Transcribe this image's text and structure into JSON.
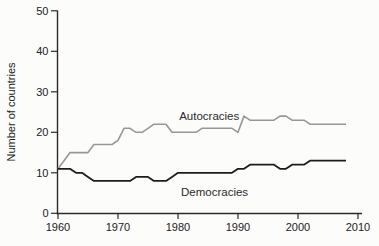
{
  "chart_data": {
    "type": "line",
    "title": "",
    "xlabel": "",
    "ylabel": "Number of countries",
    "x_ticks": [
      1960,
      1970,
      1980,
      1990,
      2000,
      2010
    ],
    "y_ticks": [
      0,
      10,
      20,
      30,
      40,
      50
    ],
    "xlim": [
      1960,
      2010
    ],
    "ylim": [
      0,
      50
    ],
    "grid": false,
    "legend_position": "inline-labels",
    "x_start_year": 1960,
    "x": [
      1960,
      1961,
      1962,
      1963,
      1964,
      1965,
      1966,
      1967,
      1968,
      1969,
      1970,
      1971,
      1972,
      1973,
      1974,
      1975,
      1976,
      1977,
      1978,
      1979,
      1980,
      1981,
      1982,
      1983,
      1984,
      1985,
      1986,
      1987,
      1988,
      1989,
      1990,
      1991,
      1992,
      1993,
      1994,
      1995,
      1996,
      1997,
      1998,
      1999,
      2000,
      2001,
      2002,
      2003,
      2004,
      2005,
      2006,
      2007,
      2008
    ],
    "series": [
      {
        "name": "Autocracies",
        "color": "#979797",
        "stroke_width": 1.6,
        "label": "Autocracies",
        "label_anchor": {
          "year": 1980.2,
          "value": 23.0
        },
        "values": [
          11,
          13,
          15,
          15,
          15,
          15,
          17,
          17,
          17,
          17,
          18,
          21,
          21,
          20,
          20,
          21,
          22,
          22,
          22,
          20,
          20,
          20,
          20,
          20,
          21,
          21,
          21,
          21,
          21,
          21,
          20,
          24,
          23,
          23,
          23,
          23,
          23,
          24,
          24,
          23,
          23,
          23,
          22,
          22,
          22,
          22,
          22,
          22,
          22
        ]
      },
      {
        "name": "Democracies",
        "color": "#1c1c1c",
        "stroke_width": 1.8,
        "label": "Democracies",
        "label_anchor": {
          "year": 1980.5,
          "value": 4.3
        },
        "values": [
          11,
          11,
          11,
          10,
          10,
          9,
          8,
          8,
          8,
          8,
          8,
          8,
          8,
          9,
          9,
          9,
          8,
          8,
          8,
          9,
          10,
          10,
          10,
          10,
          10,
          10,
          10,
          10,
          10,
          10,
          11,
          11,
          12,
          12,
          12,
          12,
          12,
          11,
          11,
          12,
          12,
          12,
          13,
          13,
          13,
          13,
          13,
          13,
          13
        ]
      }
    ]
  }
}
